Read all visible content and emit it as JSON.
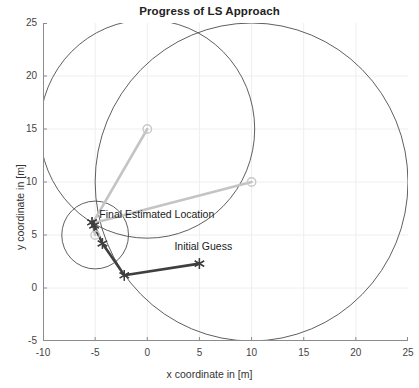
{
  "chart_data": {
    "type": "scatter",
    "title": "Progress of LS Approach",
    "xlabel": "x coordinate in [m]",
    "ylabel": "y coordinate in [m]",
    "xlim": [
      -10,
      25
    ],
    "ylim": [
      -5,
      25
    ],
    "xticks": [
      -10,
      -5,
      0,
      5,
      10,
      15,
      20,
      25
    ],
    "yticks": [
      -5,
      0,
      5,
      10,
      15,
      20,
      25
    ],
    "grid": true,
    "legend": "none",
    "colors": {
      "circle_stroke": "#4d4d4d",
      "anchor_marker": "#c8c8c8",
      "anchor_link": "#c4c4c4",
      "iteration_path": "#3f3f3f",
      "grid": "#eeeeee",
      "axis": "#8c8c8c",
      "text": "#333333"
    },
    "annotations": [
      {
        "name": "final-estimated-location",
        "text": "Final Estimated Location",
        "x": -4.6,
        "y": 6.9
      },
      {
        "name": "initial-guess",
        "text": "Initial Guess",
        "x": 2.6,
        "y": 3.9
      }
    ],
    "anchors": [
      {
        "name": "anchor-1",
        "x": 0,
        "y": 15,
        "range": 10.3
      },
      {
        "name": "anchor-2",
        "x": 10,
        "y": 10,
        "range": 15.0
      },
      {
        "name": "anchor-3",
        "x": -5,
        "y": 5,
        "range": 3.2
      }
    ],
    "range_circles": [
      {
        "cx": 0,
        "cy": 15,
        "r": 10.3
      },
      {
        "cx": 10,
        "cy": 10,
        "r": 15.0
      },
      {
        "cx": -5,
        "cy": 5,
        "r": 3.2
      }
    ],
    "anchor_links": [
      {
        "from": [
          0,
          15
        ],
        "to": [
          -5.25,
          6.1
        ]
      },
      {
        "from": [
          10,
          10
        ],
        "to": [
          -5.25,
          6.1
        ]
      },
      {
        "from": [
          -5,
          5
        ],
        "to": [
          -5.25,
          6.1
        ]
      }
    ],
    "iteration_path": {
      "name": "ls-iteration-path",
      "points": [
        [
          5,
          2.3
        ],
        [
          -2.2,
          1.2
        ],
        [
          -4.3,
          4.2
        ],
        [
          -5.1,
          5.9
        ],
        [
          -5.3,
          6.2
        ]
      ]
    },
    "estimate_markers": [
      {
        "name": "estimate-initial-guess",
        "x": 5,
        "y": 2.3
      },
      {
        "name": "estimate-iter-1",
        "x": -2.2,
        "y": 1.2
      },
      {
        "name": "estimate-iter-2",
        "x": -4.3,
        "y": 4.2
      },
      {
        "name": "estimate-iter-3",
        "x": -5.1,
        "y": 5.9
      },
      {
        "name": "estimate-final",
        "x": -5.3,
        "y": 6.2
      }
    ]
  }
}
